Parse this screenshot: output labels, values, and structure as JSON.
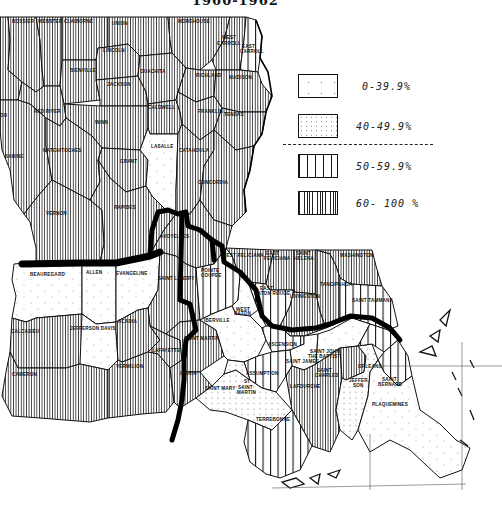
{
  "title_partial": "1960-1962",
  "legend": {
    "items": [
      {
        "range": "0-39.9%",
        "pattern": "sparse-dots"
      },
      {
        "range": "40-49.9%",
        "pattern": "dense-dots"
      },
      {
        "range": "50-59.9%",
        "pattern": "wide-vertical-lines"
      },
      {
        "range": "60- 100 %",
        "pattern": "dense-vertical-lines"
      }
    ],
    "divider": "dashed"
  },
  "parishes": [
    {
      "name": "BOSSIER",
      "class": "60-100"
    },
    {
      "name": "WEBSTER",
      "class": "60-100"
    },
    {
      "name": "CLAIBORNE",
      "class": "60-100"
    },
    {
      "name": "UNION",
      "class": "60-100"
    },
    {
      "name": "MOREHOUSE",
      "class": "60-100"
    },
    {
      "name": "WEST CARROLL",
      "class": "60-100"
    },
    {
      "name": "EAST CARROLL",
      "class": "50-59.9"
    },
    {
      "name": "LINCOLN",
      "class": "60-100"
    },
    {
      "name": "BIENVILLE",
      "class": "60-100"
    },
    {
      "name": "JACKSON",
      "class": "60-100"
    },
    {
      "name": "OUACHITA",
      "class": "60-100"
    },
    {
      "name": "RICHLAND",
      "class": "60-100"
    },
    {
      "name": "MADISON",
      "class": "60-100"
    },
    {
      "name": "CADDO",
      "class": "60-100"
    },
    {
      "name": "RED RIVER",
      "class": "60-100"
    },
    {
      "name": "WINN",
      "class": "60-100"
    },
    {
      "name": "CALDWELL",
      "class": "60-100"
    },
    {
      "name": "FRANKLIN",
      "class": "60-100"
    },
    {
      "name": "TENSAS",
      "class": "60-100"
    },
    {
      "name": "SABINE",
      "class": "60-100"
    },
    {
      "name": "NATCHITOCHES",
      "class": "60-100"
    },
    {
      "name": "GRANT",
      "class": "60-100"
    },
    {
      "name": "LASALLE",
      "class": "0-39.9"
    },
    {
      "name": "CATAHOULA",
      "class": "60-100"
    },
    {
      "name": "CONCORDIA",
      "class": "60-100"
    },
    {
      "name": "VERNON",
      "class": "60-100"
    },
    {
      "name": "RAPIDES",
      "class": "60-100"
    },
    {
      "name": "AVOYELLES",
      "class": "60-100"
    },
    {
      "name": "BEAUREGARD",
      "class": "0-39.9"
    },
    {
      "name": "ALLEN",
      "class": "0-39.9"
    },
    {
      "name": "EVANGELINE",
      "class": "0-39.9"
    },
    {
      "name": "SAINT LANDRY",
      "class": "60-100"
    },
    {
      "name": "POINTE COUPEE",
      "class": "50-59.9"
    },
    {
      "name": "WEST FELICIANA",
      "class": "60-100"
    },
    {
      "name": "EAST FELICIANA",
      "class": "60-100"
    },
    {
      "name": "SAINT HELENA",
      "class": "60-100"
    },
    {
      "name": "WASHINGTON",
      "class": "60-100"
    },
    {
      "name": "EAST BATON ROUGE",
      "class": "50-59.9"
    },
    {
      "name": "LIVINGSTON",
      "class": "60-100"
    },
    {
      "name": "TANGIPAHOA",
      "class": "60-100"
    },
    {
      "name": "SAINT TAMMANY",
      "class": "50-59.9"
    },
    {
      "name": "WEST BATON ROUGE",
      "class": "0-39.9"
    },
    {
      "name": "IBERVILLE",
      "class": "0-39.9"
    },
    {
      "name": "CALCASIEU",
      "class": "60-100"
    },
    {
      "name": "JEFFERSON DAVIS",
      "class": "0-39.9"
    },
    {
      "name": "ACADIA",
      "class": "60-100"
    },
    {
      "name": "LAFAYETTE",
      "class": "60-100"
    },
    {
      "name": "SAINT MARTIN",
      "class": "60-100"
    },
    {
      "name": "CAMERON",
      "class": "60-100"
    },
    {
      "name": "VERMILION",
      "class": "60-100"
    },
    {
      "name": "IBERIA",
      "class": "60-100"
    },
    {
      "name": "ASCENSION",
      "class": "50-59.9"
    },
    {
      "name": "SAINT JAMES",
      "class": "0-39.9"
    },
    {
      "name": "SAINT JOHN THE BAPTIST",
      "class": "0-39.9"
    },
    {
      "name": "ASSUMPTION",
      "class": "50-59.9"
    },
    {
      "name": "SAINT MARY",
      "class": "40-49.9"
    },
    {
      "name": "SAINT MARTIN (LOWER)",
      "class": "40-49.9"
    },
    {
      "name": "LAFOURCHE",
      "class": "60-100"
    },
    {
      "name": "TERREBONNE",
      "class": "50-59.9"
    },
    {
      "name": "SAINT CHARLES",
      "class": "60-100"
    },
    {
      "name": "JEFFERSON",
      "class": "40-49.9"
    },
    {
      "name": "ORLEANS",
      "class": "50-59.9"
    },
    {
      "name": "SAINT BERNARD",
      "class": "50-59.9"
    },
    {
      "name": "PLAQUEMINES",
      "class": "0-39.9"
    }
  ],
  "labels": {
    "bossier": "BOSSIER",
    "webster": "WEBSTER",
    "claiborne": "CLAIBORNE",
    "union": "UNION",
    "morehouse": "MOREHOUSE",
    "west_carroll_1": "WEST",
    "west_carroll_2": "CARROLL",
    "east_carroll_1": "EAST",
    "east_carroll_2": "CARROLL",
    "lincoln": "LINCOLN",
    "bienville": "BIENVILLE",
    "jackson": "JACKSON",
    "ouachita": "OUACHITA",
    "richland": "RICHLAND",
    "madison": "MADISON",
    "caddo": "DO",
    "red_river": "RED RIVER",
    "winn": "WINN",
    "caldwell": "CALDWELL",
    "franklin": "FRANKLIN",
    "tensas": "TENSAS",
    "sabine": "SABINE",
    "natchitoches": "NATCHITOCHES",
    "grant": "GRANT",
    "lasalle": "LASALLE",
    "catahoula": "CATAHOULA",
    "concordia": "CONCORDIA",
    "vernon": "VERNON",
    "rapides": "RAPIDES",
    "avoyelles": "AVOYELLES",
    "beauregard": "BEAUREGARD",
    "allen": "ALLEN",
    "evangeline": "EVANGELINE",
    "st_landry": "SAINT LANDRY",
    "pointe_coupee_1": "POINTE",
    "pointe_coupee_2": "COUPEE",
    "west_feliciana": "WEST FELICIANA",
    "east_feliciana_1": "EAST",
    "east_feliciana_2": "FELICIANA",
    "st_helena_1": "SAINT",
    "st_helena_2": "HELENA",
    "washington": "WASHINGTON",
    "ebr_1": "EAST",
    "ebr_2": "BATON ROUGE",
    "livingston": "LIVINGSTON",
    "tangipahoa": "TANGIPAHOA",
    "st_tammany": "SAINT TAMMANY",
    "wbr_1": "WEST",
    "wbr_2": "BATON",
    "iberville": "IBERVILLE",
    "calcasieu": "CALCASIEU",
    "jeff_davis": "JEFFERSON DAVIS",
    "acadia": "ACADIA",
    "lafayette": "LAFAYETTE",
    "st_martin": "SAINT MARTIN",
    "cameron": "CAMERON",
    "vermilion": "VERMILION",
    "iberia": "IBERIA",
    "ascension": "ASCENSION",
    "st_james": "SAINT JAMES",
    "st_john_1": "SAINT JOHN",
    "st_john_2": "THE BAPTIST",
    "assumption": "ASSUMPTION",
    "st_mary": "SAINT MARY",
    "st_martin_lower_1": "ST",
    "st_martin_lower_2": "SAINT",
    "st_martin_lower_3": "MARTIN",
    "lafourche": "LAFOURCHE",
    "terrebonne": "TERREBONNE",
    "st_charles_1": "SAINT",
    "st_charles_2": "CHARLES",
    "jefferson_1": "JEFFER",
    "jefferson_2": "SON",
    "orleans": "ORLEANS",
    "st_bernard_1": "SAINT",
    "st_bernard_2": "BERNARD",
    "plaquemines": "PLAQUEMINES"
  }
}
